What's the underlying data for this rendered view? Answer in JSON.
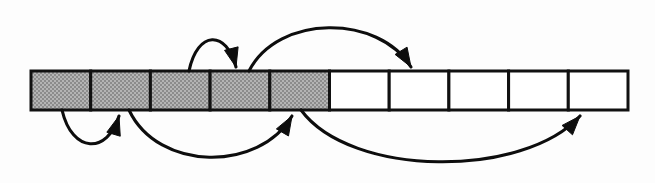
{
  "figure": {
    "width": 655,
    "height": 183,
    "background_color": "#fdfdfd"
  },
  "colors": {
    "outline": "#111111",
    "filled_cell": "#a0a0a0",
    "empty_cell": "#ffffff",
    "arrow": "#0d0d0d"
  },
  "array": {
    "name": "cell-strip",
    "origin_x": 31,
    "origin_y": 71,
    "cell_width": 59.7,
    "cell_height": 39,
    "cell_count": 10,
    "filled_count": 5,
    "cells": [
      {
        "index": 0,
        "state": "filled",
        "label": ""
      },
      {
        "index": 1,
        "state": "filled",
        "label": ""
      },
      {
        "index": 2,
        "state": "filled",
        "label": ""
      },
      {
        "index": 3,
        "state": "filled",
        "label": ""
      },
      {
        "index": 4,
        "state": "filled",
        "label": ""
      },
      {
        "index": 5,
        "state": "empty",
        "label": ""
      },
      {
        "index": 6,
        "state": "empty",
        "label": ""
      },
      {
        "index": 7,
        "state": "empty",
        "label": ""
      },
      {
        "index": 8,
        "state": "empty",
        "label": ""
      },
      {
        "index": 9,
        "state": "empty",
        "label": ""
      }
    ]
  },
  "arrows": {
    "above": [
      {
        "name": "arrow-above-short",
        "side": "above",
        "from_x": 189,
        "to_x": 236,
        "peak_y": 30,
        "direction": "right",
        "label": ""
      },
      {
        "name": "arrow-above-long",
        "side": "above",
        "from_x": 249,
        "to_x": 411,
        "peak_y": 14,
        "direction": "right",
        "label": ""
      }
    ],
    "below": [
      {
        "name": "arrow-below-short",
        "side": "below",
        "from_x": 62,
        "to_x": 119,
        "trough_y": 154,
        "direction": "right",
        "label": ""
      },
      {
        "name": "arrow-below-medium",
        "side": "below",
        "from_x": 129,
        "to_x": 292,
        "trough_y": 172,
        "direction": "right",
        "label": ""
      },
      {
        "name": "arrow-below-long",
        "side": "below",
        "from_x": 301,
        "to_x": 580,
        "trough_y": 178,
        "direction": "right",
        "label": ""
      }
    ]
  }
}
